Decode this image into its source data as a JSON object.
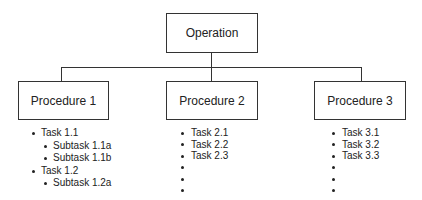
{
  "diagram": {
    "type": "hierarchy",
    "root": {
      "label": "Operation"
    },
    "procedures": [
      {
        "label": "Procedure 1",
        "items": [
          {
            "label": "Task 1.1",
            "level": 1
          },
          {
            "label": "Subtask 1.1a",
            "level": 2
          },
          {
            "label": "Subtask 1.1b",
            "level": 2
          },
          {
            "label": "Task 1.2",
            "level": 1
          },
          {
            "label": "Subtask 1.2a",
            "level": 2
          }
        ]
      },
      {
        "label": "Procedure 2",
        "items": [
          {
            "label": "Task 2.1",
            "level": 1
          },
          {
            "label": "Task 2.2",
            "level": 1
          },
          {
            "label": "Task 2.3",
            "level": 1
          },
          {
            "label": "",
            "level": 1
          },
          {
            "label": "",
            "level": 1
          },
          {
            "label": "",
            "level": 1
          }
        ]
      },
      {
        "label": "Procedure 3",
        "items": [
          {
            "label": "Task 3.1",
            "level": 1
          },
          {
            "label": "Task 3.2",
            "level": 1
          },
          {
            "label": "Task 3.3",
            "level": 1
          },
          {
            "label": "",
            "level": 1
          },
          {
            "label": "",
            "level": 1
          },
          {
            "label": "",
            "level": 1
          }
        ]
      }
    ],
    "colors": {
      "line": "#333333",
      "text": "#222222",
      "background": "#ffffff"
    }
  }
}
